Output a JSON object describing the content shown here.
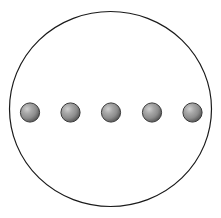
{
  "figure": {
    "type": "diagram",
    "name": "spheres-in-circle-diagram",
    "description": "Five shaded gray spheres arranged in a horizontal row inside a large thin-outlined circle",
    "canvas": {
      "width": 221,
      "height": 218,
      "background_color": "#ffffff"
    },
    "boundary_circle": {
      "label": "outer-circle",
      "center_x": 110.5,
      "center_y": 109,
      "radius_x": 101,
      "radius_y": 97.5,
      "stroke_color": "#1a1a1a",
      "stroke_width": 1.2,
      "fill_color": "none"
    },
    "spheres": {
      "count": 5,
      "radius": 9.6,
      "center_y": 112.5,
      "outline_color": "#3a3a3a",
      "outline_width": 1,
      "base_color": "#8f8f8f",
      "highlight_color": "#cfcfcf",
      "shadow_color": "#5e5e5e",
      "highlight_offset_x": "35%",
      "highlight_offset_y": "32%",
      "items": [
        {
          "id": "sphere-1",
          "center_x": 30
        },
        {
          "id": "sphere-2",
          "center_x": 70.5
        },
        {
          "id": "sphere-3",
          "center_x": 111
        },
        {
          "id": "sphere-4",
          "center_x": 152
        },
        {
          "id": "sphere-5",
          "center_x": 192.5
        }
      ]
    }
  }
}
